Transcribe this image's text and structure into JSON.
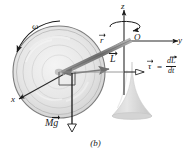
{
  "figure": {
    "caption": "(b)",
    "colors": {
      "ink": "#1a1a1a",
      "wheel_fill": "#e8e8e8",
      "wheel_stroke": "#8c8c8c",
      "shaft": "#8a8a8a",
      "stand": "#d6d6d6",
      "axis": "#3a3a3a"
    }
  },
  "axes": {
    "z_label": "z",
    "y_label": "y",
    "x_label": "x",
    "origin_label": "O"
  },
  "vectors": {
    "omega_label": "ω",
    "r_label": "r",
    "L_label": "L",
    "weight_label_M": "M",
    "weight_label_g": "g",
    "torque_label": "τ"
  },
  "equation": {
    "equals": "=",
    "numerator": "dL",
    "denominator": "dt"
  }
}
